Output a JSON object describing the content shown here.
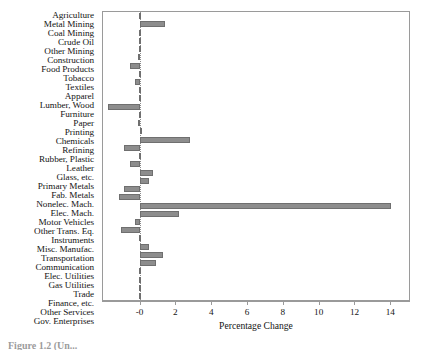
{
  "chart_data": {
    "type": "bar",
    "orientation": "horizontal",
    "title": "",
    "xlabel": "Percentage Change",
    "ylabel": "",
    "xlim": [
      -2.1,
      15.1
    ],
    "xticks": [
      0,
      2,
      4,
      6,
      8,
      10,
      12,
      14
    ],
    "xticklabels": [
      "-0",
      "2",
      "4",
      "6",
      "8",
      "10",
      "12",
      "14"
    ],
    "grid": false,
    "legend": null,
    "bar_color": "#8d8d8d",
    "bar_edge_color": "#6f6f6f",
    "zero_reference_line": true,
    "categories": [
      "Agriculture",
      "Metal Mining",
      "Coal Mining",
      "Crude Oil",
      "Other Mining",
      "Construction",
      "Food Products",
      "Tobacco",
      "Textiles",
      "Apparel",
      "Lumber, Wood",
      "Furniture",
      "Paper",
      "Printing",
      "Chemicals",
      "Refining",
      "Rubber, Plastic",
      "Leather",
      "Glass, etc.",
      "Primary Metals",
      "Fab. Metals",
      "Nonelec. Mach.",
      "Elec. Mach.",
      "Motor Vehicles",
      "Other Trans. Eq.",
      "Instruments",
      "Misc. Manufac.",
      "Transportation",
      "Communication",
      "Elec. Utilities",
      "Gas Utilities",
      "Trade",
      "Finance, etc.",
      "Other Services",
      "Gov. Enterprises"
    ],
    "values": [
      -0.05,
      1.4,
      -0.1,
      -0.05,
      -0.1,
      -0.15,
      -0.6,
      -0.1,
      -0.3,
      -0.1,
      -0.1,
      -1.8,
      -0.1,
      -0.15,
      0.1,
      2.8,
      -0.9,
      -0.05,
      -0.6,
      0.7,
      0.5,
      -0.9,
      -1.2,
      14.1,
      2.2,
      -0.3,
      -1.1,
      -0.1,
      0.5,
      1.3,
      0.9,
      -0.05,
      -0.05,
      -0.05,
      -0.1
    ]
  },
  "caption": {
    "text": "Figure 1.2 (Un..."
  }
}
